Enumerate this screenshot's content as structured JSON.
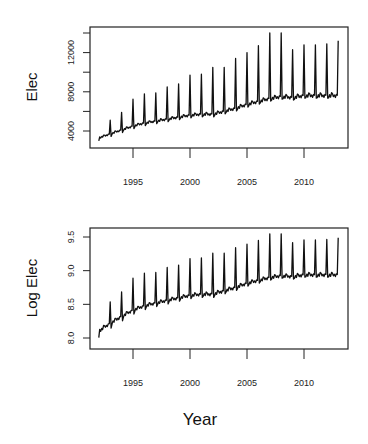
{
  "chart_data": [
    {
      "type": "line",
      "title": "",
      "xlabel": "",
      "ylabel": "Elec",
      "xlim": [
        1991.5,
        2013.8
      ],
      "ylim": [
        3000,
        14500
      ],
      "grid": false,
      "x_ticks": [
        1995,
        2000,
        2005,
        2010
      ],
      "x_tick_labels": [
        "1995",
        "2000",
        "2005",
        "2010"
      ],
      "y_ticks": [
        4000,
        6000,
        8000,
        10000,
        12000,
        14000
      ],
      "y_tick_labels": [
        "4000",
        "",
        "8000",
        "",
        "12000",
        ""
      ],
      "series": [
        {
          "name": "Elec",
          "start": 1992.0,
          "years": [
            1992,
            1993,
            1994,
            1995,
            1996,
            1997,
            1998,
            1999,
            2000,
            2001,
            2002,
            2003,
            2004,
            2005,
            2006,
            2007,
            2008,
            2009,
            2010,
            2011,
            2012
          ],
          "baseline": [
            3300,
            3700,
            4100,
            4500,
            4800,
            5000,
            5200,
            5400,
            5600,
            5700,
            5700,
            6000,
            6300,
            6700,
            7000,
            7300,
            7500,
            7400,
            7600,
            7600,
            7600
          ],
          "january_peaks": [
            5100,
            5900,
            7250,
            7800,
            7900,
            8500,
            8800,
            9700,
            9800,
            10500,
            10500,
            11400,
            12000,
            12700,
            14000,
            14000,
            12300,
            12800,
            12800,
            12900,
            13200
          ],
          "peak_years": [
            1993,
            1994,
            1995,
            1996,
            1997,
            1998,
            1999,
            2000,
            2001,
            2002,
            2003,
            2004,
            2005,
            2006,
            2007,
            2008,
            2009,
            2010,
            2011,
            2012,
            2013
          ]
        }
      ]
    },
    {
      "type": "line",
      "title": "",
      "xlabel": "Year",
      "ylabel": "Log Elec",
      "xlim": [
        1991.5,
        2013.8
      ],
      "ylim": [
        7.88,
        9.6
      ],
      "grid": false,
      "x_ticks": [
        1995,
        2000,
        2005,
        2010
      ],
      "x_tick_labels": [
        "1995",
        "2000",
        "2005",
        "2010"
      ],
      "y_ticks": [
        8.0,
        8.5,
        9.0,
        9.5
      ],
      "y_tick_labels": [
        "8.0",
        "8.5",
        "9.0",
        "9.5"
      ],
      "series": [
        {
          "name": "Log Elec",
          "transform": "natural log of Elec",
          "start": 1992.0
        }
      ]
    }
  ],
  "plots": {
    "top": {
      "ylabel": "Elec",
      "x_tick_labels": [
        "1995",
        "2000",
        "2005",
        "2010"
      ],
      "y_tick_labels": [
        "4000",
        "8000",
        "12000"
      ]
    },
    "bottom": {
      "ylabel": "Log Elec",
      "x_tick_labels": [
        "1995",
        "2000",
        "2005",
        "2010"
      ],
      "y_tick_labels": [
        "8.0",
        "8.5",
        "9.0",
        "9.5"
      ]
    }
  },
  "xlabel": "Year",
  "colors": {
    "line": "#111111",
    "frame": "#222222",
    "background": "#ffffff"
  }
}
